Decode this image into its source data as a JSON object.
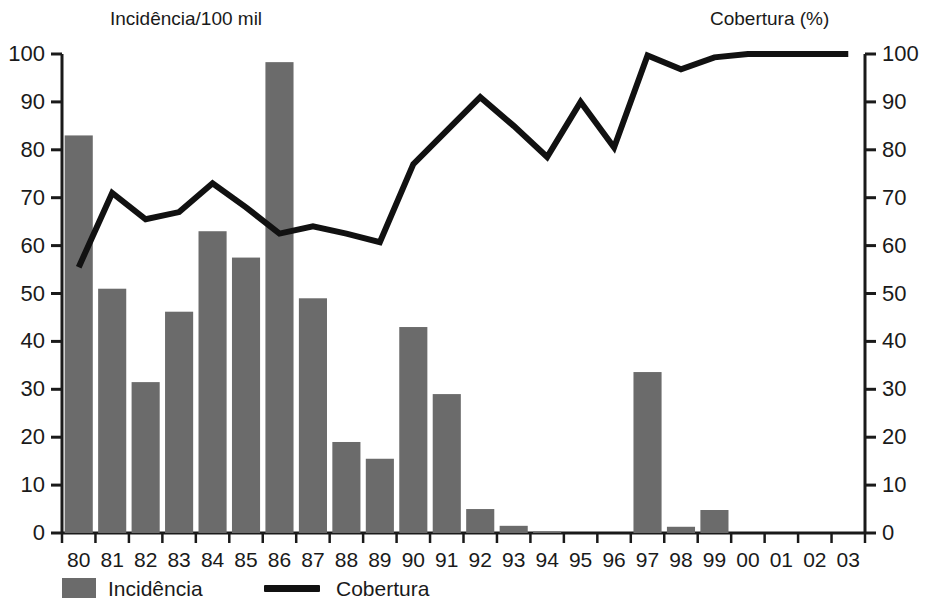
{
  "chart_data": {
    "type": "bar",
    "title": "",
    "categories": [
      "80",
      "81",
      "82",
      "83",
      "84",
      "85",
      "86",
      "87",
      "88",
      "89",
      "90",
      "91",
      "92",
      "93",
      "94",
      "95",
      "96",
      "97",
      "98",
      "99",
      "00",
      "01",
      "02",
      "03"
    ],
    "xlabel": "",
    "left_axis": {
      "label": "Incidência/100 mil",
      "ticks": [
        0,
        10,
        20,
        30,
        40,
        50,
        60,
        70,
        80,
        90,
        100
      ],
      "ylim": [
        0,
        100
      ]
    },
    "right_axis": {
      "label": "Cobertura (%)",
      "ticks": [
        0,
        10,
        20,
        30,
        40,
        50,
        60,
        70,
        80,
        90,
        100
      ],
      "ylim": [
        0,
        100
      ]
    },
    "grid": false,
    "legend_position": "bottom",
    "series": [
      {
        "name": "Incidência",
        "type": "bar",
        "axis": "left",
        "color": "#6b6b6b",
        "values": [
          83,
          51,
          31.5,
          46.2,
          63,
          57.5,
          98.3,
          49,
          19,
          15.5,
          43,
          29,
          5,
          1.5,
          0.3,
          0,
          0,
          33.6,
          1.3,
          4.8,
          0,
          0,
          0,
          0
        ]
      },
      {
        "name": "Cobertura",
        "type": "line",
        "axis": "right",
        "color": "#111111",
        "values": [
          55.5,
          71,
          65.5,
          67,
          73,
          68,
          62.5,
          64,
          62.5,
          60.7,
          77,
          84,
          91,
          85,
          78.5,
          90,
          80.5,
          99.7,
          96.8,
          99.3,
          100,
          100,
          100,
          100
        ]
      }
    ]
  },
  "legend": {
    "items": [
      {
        "label": "Incidência",
        "marker": "bar-swatch"
      },
      {
        "label": "Cobertura",
        "marker": "line-swatch"
      }
    ]
  }
}
